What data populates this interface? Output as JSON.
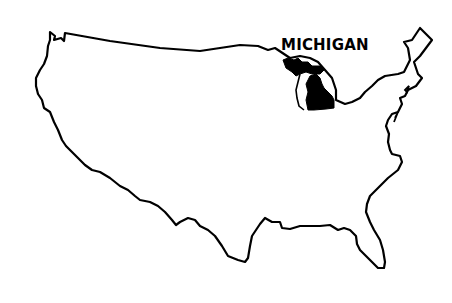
{
  "map": {
    "region": "United States",
    "highlighted_state": "Michigan",
    "label": "MICHIGAN",
    "colors": {
      "background": "#ffffff",
      "outline": "#000000",
      "highlight_fill": "#000000"
    }
  }
}
